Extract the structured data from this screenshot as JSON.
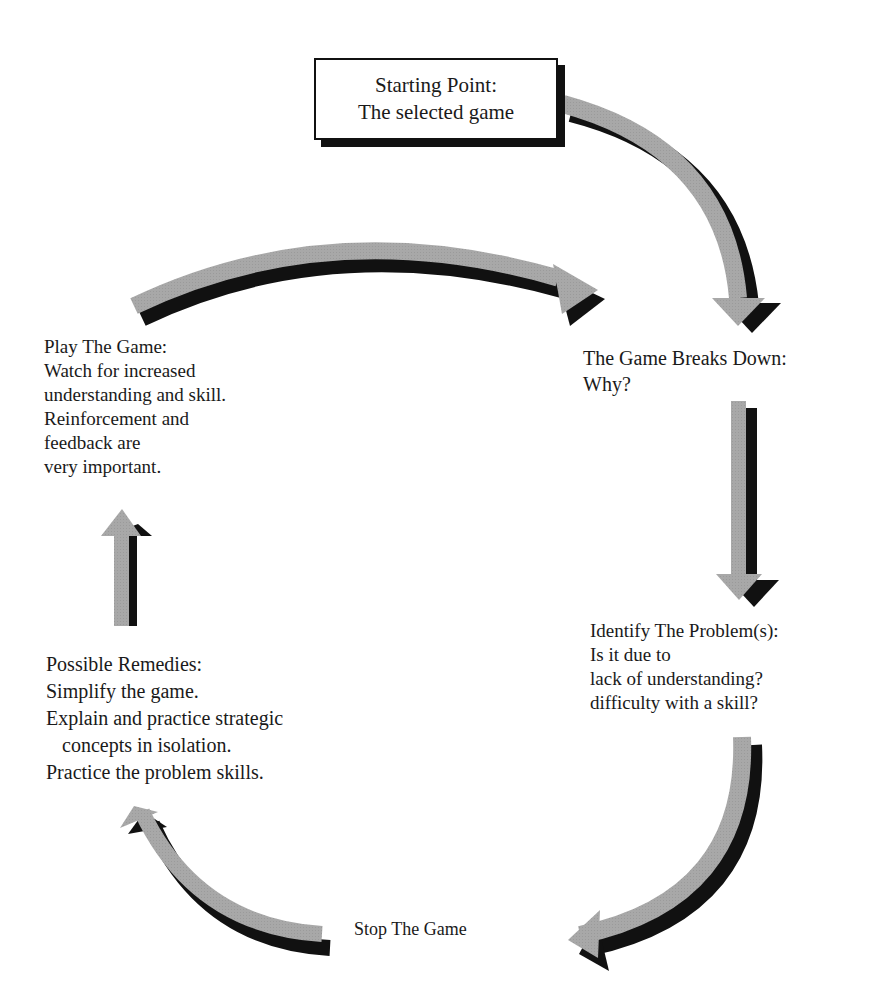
{
  "diagram": {
    "type": "cycle-flowchart",
    "colors": {
      "arrow_fill": "#a6a6a6",
      "arrow_shadow": "#111111",
      "box_border": "#111111",
      "text": "#1a1a1a",
      "background": "#ffffff"
    },
    "start": {
      "line1": "Starting Point:",
      "line2": "The selected game"
    },
    "nodes": {
      "breaks_down": {
        "line1": "The Game Breaks Down:",
        "line2": "Why?"
      },
      "identify": {
        "line1": "Identify The Problem(s):",
        "line2": "Is it due to",
        "line3": "lack of understanding?",
        "line4": "difficulty with a skill?"
      },
      "stop": {
        "label": "Stop The Game"
      },
      "remedies": {
        "line1": "Possible Remedies:",
        "line2": "Simplify the game.",
        "line3": "Explain and practice strategic",
        "line4": "concepts in isolation.",
        "line5": "Practice the problem skills."
      },
      "play": {
        "line1": "Play The Game:",
        "line2": "Watch for increased",
        "line3": "understanding and skill.",
        "line4": "Reinforcement and",
        "line5": "feedback are",
        "line6": "very important."
      }
    },
    "arrows": [
      {
        "from": "start",
        "to": "breaks_down",
        "shape": "curved"
      },
      {
        "from": "breaks_down",
        "to": "identify",
        "shape": "straight-down"
      },
      {
        "from": "identify",
        "to": "stop",
        "shape": "curved"
      },
      {
        "from": "stop",
        "to": "remedies",
        "shape": "curved"
      },
      {
        "from": "remedies",
        "to": "play",
        "shape": "straight-up"
      },
      {
        "from": "play",
        "to": "breaks_down",
        "shape": "curved"
      }
    ]
  }
}
